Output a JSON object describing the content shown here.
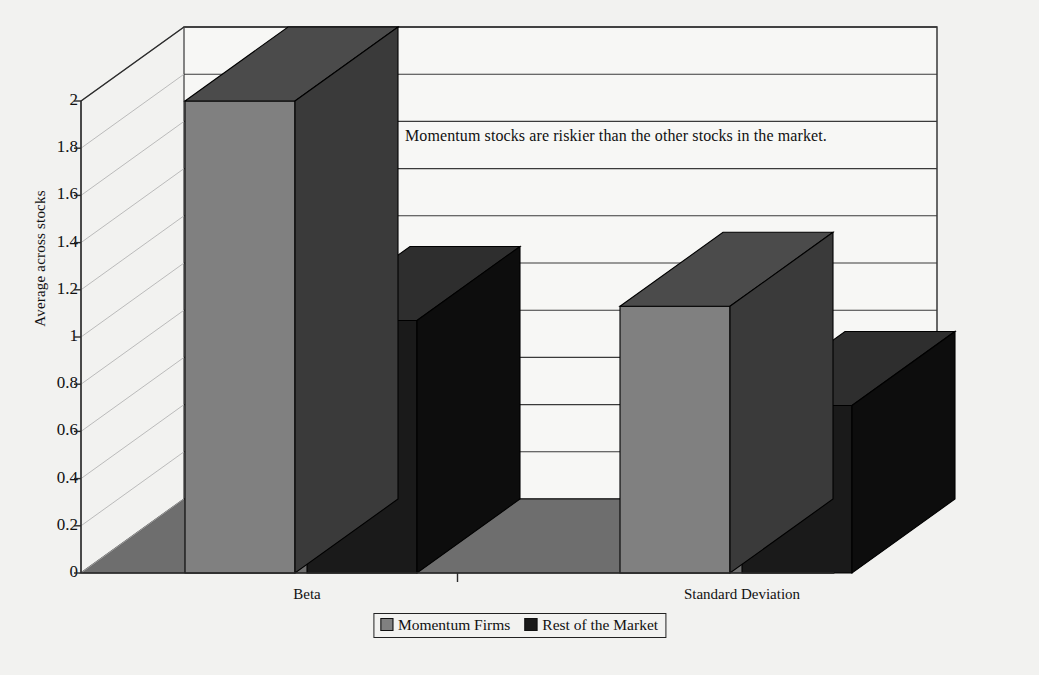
{
  "chart_data": {
    "type": "bar",
    "title": "",
    "annotation": "Momentum stocks are riskier than the other stocks in the market.",
    "categories": [
      "Beta",
      "Standard Deviation"
    ],
    "series": [
      {
        "name": "Momentum Firms",
        "values": [
          2.0,
          1.13
        ],
        "color": "#808080"
      },
      {
        "name": "Rest of the Market",
        "values": [
          1.07,
          0.71
        ],
        "color": "#1a1a1a"
      }
    ],
    "xlabel": "",
    "ylabel": "Average across stocks",
    "ylim": [
      0,
      2
    ],
    "ytick_labels": [
      "0",
      "0.2",
      "0.4",
      "0.6",
      "0.8",
      "1",
      "1.2",
      "1.4",
      "1.6",
      "1.8",
      "2"
    ],
    "ytick_values": [
      0,
      0.2,
      0.4,
      0.6,
      0.8,
      1,
      1.2,
      1.4,
      1.6,
      1.8,
      2
    ],
    "grid": true,
    "legend_position": "bottom",
    "three_d": true
  },
  "colors": {
    "background": "#f2f2f0",
    "plot_wall": "#f7f7f5",
    "floor": "#6e6e6e",
    "axis": "#2b2b2b",
    "gridline": "#3a3a3a",
    "series_light_front": "#808080",
    "series_light_top": "#4b4b4b",
    "series_light_side": "#3a3a3a",
    "series_dark_front": "#1a1a1a",
    "series_dark_top": "#2e2e2e",
    "series_dark_side": "#0d0d0d"
  }
}
